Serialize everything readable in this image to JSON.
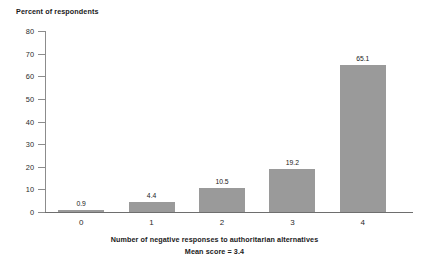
{
  "chart_data": {
    "type": "bar",
    "title": "",
    "ylabel": "Percent of respondents",
    "xlabel": "Number of negative responses to authoritarian alternatives",
    "annotation": "Mean score = 3.4",
    "categories": [
      "0",
      "1",
      "2",
      "3",
      "4"
    ],
    "values": [
      0.9,
      4.4,
      10.5,
      19.2,
      65.1
    ],
    "data_labels": [
      "0.9",
      "4.4",
      "10.5",
      "19.2",
      "65.1"
    ],
    "ylim": [
      0,
      80
    ],
    "ytick_values": [
      0,
      10,
      20,
      30,
      40,
      50,
      60,
      70,
      80
    ],
    "ytick_labels": [
      "0",
      "10",
      "20",
      "30",
      "40",
      "50",
      "60",
      "70",
      "80"
    ],
    "grid": false,
    "legend": false,
    "bar_color": "#9a9a9a",
    "axis_color": "#8c8c8c"
  }
}
